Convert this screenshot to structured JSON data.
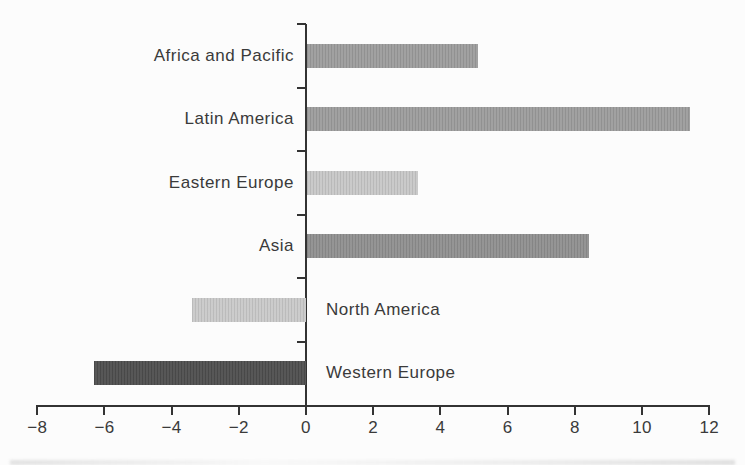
{
  "chart_data": {
    "type": "bar",
    "orientation": "horizontal",
    "title": "",
    "xlabel": "",
    "ylabel": "",
    "categories": [
      "Africa and Pacific",
      "Latin America",
      "Eastern Europe",
      "Asia",
      "North America",
      "Western Europe"
    ],
    "values": [
      5.1,
      11.4,
      3.3,
      8.4,
      -3.4,
      -6.3
    ],
    "bar_colors": [
      "#9c9c9c",
      "#9c9c9c",
      "#c7c7c7",
      "#8f8f8f",
      "#c9c9c9",
      "#4e4e4e"
    ],
    "xlim": [
      -8,
      12
    ],
    "x_ticks": [
      -8,
      -6,
      -4,
      -2,
      0,
      2,
      4,
      6,
      8,
      10,
      12
    ],
    "x_tick_labels": [
      "−8",
      "−6",
      "−4",
      "−2",
      "0",
      "2",
      "4",
      "6",
      "8",
      "10",
      "12"
    ],
    "grid": false,
    "legend": null,
    "axis_color": "#333333",
    "label_color": "#3a3a3a",
    "background": "#fcfcfc"
  }
}
